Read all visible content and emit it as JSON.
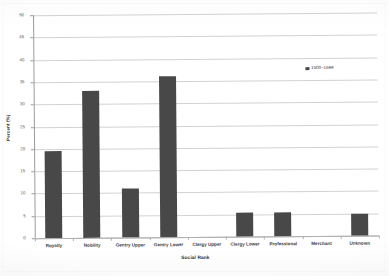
{
  "chart_data": {
    "type": "bar",
    "title": "",
    "xlabel": "Social Rank",
    "ylabel": "Percent (%)",
    "categories": [
      "Royalty",
      "Nobility",
      "Gentry Upper",
      "Gentry Lower",
      "Clergy Upper",
      "Clergy Lower",
      "Professional",
      "Merchant",
      "Unknown"
    ],
    "series": [
      {
        "name": "1500–1599",
        "values": [
          19.5,
          33.0,
          11.0,
          36.0,
          0,
          5.3,
          5.3,
          0,
          5.0
        ]
      }
    ],
    "ylim": [
      0,
      50
    ],
    "ytick_step": 5,
    "yticks": [
      0,
      5,
      10,
      15,
      20,
      25,
      30,
      35,
      40,
      45,
      50
    ],
    "ytick_labels": [
      "0",
      "5",
      "10",
      "15",
      "20",
      "25",
      "30",
      "35",
      "40",
      "45",
      "50"
    ],
    "grid": true,
    "grid_axis": "y",
    "legend_position": "upper right",
    "bar_color": "#484848",
    "gridline_color": "#d2d2d2",
    "axis_color": "#9a9a9a",
    "background_color": "#ffffff"
  },
  "legend": {
    "entries": [
      {
        "label": "1500–1599",
        "marker": "legend-square-marker",
        "color": "#484848"
      }
    ]
  }
}
